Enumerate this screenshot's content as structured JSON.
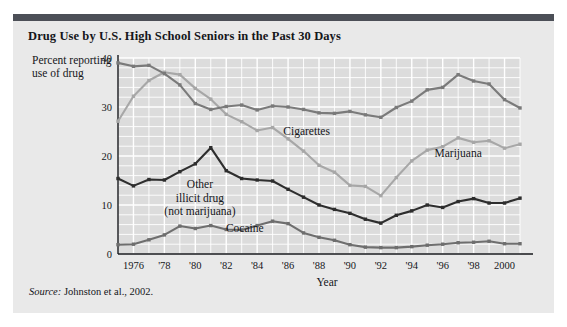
{
  "figure": {
    "title": "Drug Use by U.S. High School Seniors in the Past 30 Days",
    "source_prefix": "Source:",
    "source_text": " Johnston et al., 2002.",
    "accent_bar_color": "#4c4f57",
    "panel_color": "#e9e9e9",
    "plot_bg_color": "#dcdcdc",
    "gridline_color": "#ffffff"
  },
  "chart_data": {
    "type": "line",
    "title": "Drug Use by U.S. High School Seniors in the Past 30 Days",
    "xlabel": "Year",
    "ylabel": "Percent reporting use of drug",
    "xlim": [
      1975,
      2001
    ],
    "ylim": [
      0,
      40
    ],
    "yticks": [
      0,
      10,
      20,
      30,
      40
    ],
    "ytick_labels": [
      "0",
      "10",
      "20",
      "30",
      "40"
    ],
    "xticks": [
      1976,
      1978,
      1980,
      1982,
      1984,
      1986,
      1988,
      1990,
      1992,
      1994,
      1996,
      1998,
      2000
    ],
    "xtick_labels": [
      "1976",
      "'78",
      "'80",
      "'82",
      "'84",
      "'86",
      "'88",
      "'90",
      "'92",
      "'94",
      "'96",
      "'98",
      "2000"
    ],
    "grid": true,
    "minor_grid_x_step": 1,
    "minor_grid_y_step": 2,
    "legend": "inline-annotations",
    "x": [
      1975,
      1976,
      1977,
      1978,
      1979,
      1980,
      1981,
      1982,
      1983,
      1984,
      1985,
      1986,
      1987,
      1988,
      1989,
      1990,
      1991,
      1992,
      1993,
      1994,
      1995,
      1996,
      1997,
      1998,
      1999,
      2000,
      2001
    ],
    "series": [
      {
        "name": "Cigarettes",
        "color": "#7a7a7a",
        "marker": "square",
        "label_x": 1987.2,
        "label_y": 24.2,
        "values": [
          39.0,
          38.3,
          38.5,
          36.8,
          34.5,
          30.7,
          29.5,
          30.1,
          30.4,
          29.4,
          30.2,
          30.0,
          29.5,
          28.8,
          28.7,
          29.1,
          28.4,
          27.9,
          29.9,
          31.2,
          33.5,
          34.0,
          36.6,
          35.3,
          34.7,
          31.5,
          29.8
        ]
      },
      {
        "name": "Marijuana",
        "color": "#a7a7a7",
        "marker": "square",
        "label_x": 1997.0,
        "label_y": 19.7,
        "values": [
          27.1,
          32.2,
          35.4,
          37.1,
          36.6,
          33.8,
          31.6,
          28.5,
          27.0,
          25.2,
          25.8,
          23.5,
          21.0,
          18.1,
          16.7,
          14.0,
          13.8,
          11.9,
          15.6,
          19.0,
          21.2,
          21.9,
          23.7,
          22.8,
          23.1,
          21.6,
          22.4
        ]
      },
      {
        "name": "Other illicit drug (not marijuana)",
        "color": "#2e2e2e",
        "marker": "square",
        "label_x": 1980.3,
        "label_y": 13.4,
        "values": [
          15.4,
          13.9,
          15.2,
          15.1,
          16.8,
          18.4,
          21.7,
          17.0,
          15.4,
          15.1,
          14.9,
          13.2,
          11.6,
          10.0,
          9.1,
          8.3,
          7.1,
          6.3,
          7.9,
          8.8,
          10.0,
          9.5,
          10.7,
          11.3,
          10.4,
          10.4,
          11.4
        ]
      },
      {
        "name": "Cocaine",
        "color": "#6e6e6e",
        "marker": "square",
        "label_x": 1983.2,
        "label_y": 4.5,
        "values": [
          1.9,
          2.0,
          2.9,
          3.9,
          5.7,
          5.2,
          5.8,
          5.0,
          4.9,
          5.8,
          6.7,
          6.2,
          4.3,
          3.4,
          2.8,
          1.9,
          1.4,
          1.3,
          1.3,
          1.5,
          1.8,
          2.0,
          2.3,
          2.4,
          2.6,
          2.1,
          2.1
        ]
      }
    ],
    "annotations": [
      {
        "text": "Cigarettes"
      },
      {
        "text": "Marijuana"
      },
      {
        "text": "Other",
        "group": "other-illicit"
      },
      {
        "text": "illicit drug",
        "group": "other-illicit"
      },
      {
        "text": "(not marijuana)",
        "group": "other-illicit"
      },
      {
        "text": "Cocaine"
      }
    ]
  }
}
